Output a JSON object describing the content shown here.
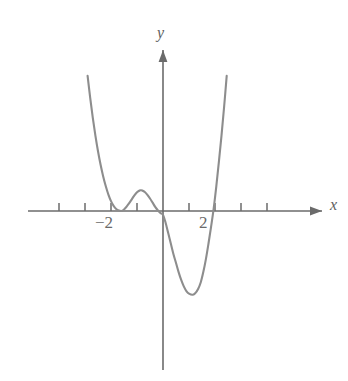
{
  "figure": {
    "background_color": "#ffffff",
    "curve_color": "#8d8d8d",
    "axis_color": "#6b6b6b",
    "text_color": "#6a6a6a"
  },
  "axes": {
    "x_label": "x",
    "y_label": "y",
    "x_axis_name": "horizontal-axis",
    "y_axis_name": "vertical-axis",
    "x_arrow": "arrow-right",
    "y_arrow": "arrow-up"
  },
  "tick_labels": {
    "negative_two": "−2",
    "positive_two": "2"
  },
  "chart_data": {
    "type": "line",
    "title": "",
    "xlabel": "x",
    "ylabel": "y",
    "grid": false,
    "legend": null,
    "xlim": [
      -4.9,
      5.4
    ],
    "ylim": [
      -6.2,
      5.2
    ],
    "x_ticks": [
      -4,
      -3,
      -2,
      -1,
      1,
      2,
      3,
      4
    ],
    "x_tick_labels_shown": [
      "-2",
      "2"
    ],
    "y_ticks": [],
    "roots": [
      -2,
      -2,
      0,
      1.95
    ],
    "features": {
      "tangent_double_root_at": -2,
      "crosses_at_origin": 0,
      "crosses_at": 1.95,
      "local_maximum": {
        "x": -0.85,
        "y": 0.8
      },
      "local_minimum": {
        "x": 1.15,
        "y": -3.2
      },
      "end_behavior": "rises on both ends (even degree, positive leading coefficient)",
      "degree": 4
    },
    "series": [
      {
        "name": "quartic-curve",
        "points": [
          [
            -2.9,
            5.2
          ],
          [
            -2.8,
            4.35
          ],
          [
            -2.7,
            3.58
          ],
          [
            -2.6,
            2.9
          ],
          [
            -2.5,
            2.3
          ],
          [
            -2.4,
            1.78
          ],
          [
            -2.3,
            1.33
          ],
          [
            -2.2,
            0.95
          ],
          [
            -2.1,
            0.63
          ],
          [
            -2.0,
            0.38
          ],
          [
            -1.9,
            0.2
          ],
          [
            -1.8,
            0.08
          ],
          [
            -1.7,
            0.02
          ],
          [
            -1.6,
            0.0
          ],
          [
            -1.5,
            0.06
          ],
          [
            -1.4,
            0.17
          ],
          [
            -1.3,
            0.3
          ],
          [
            -1.2,
            0.45
          ],
          [
            -1.1,
            0.6
          ],
          [
            -1.0,
            0.72
          ],
          [
            -0.9,
            0.79
          ],
          [
            -0.85,
            0.8
          ],
          [
            -0.8,
            0.79
          ],
          [
            -0.7,
            0.73
          ],
          [
            -0.6,
            0.62
          ],
          [
            -0.5,
            0.48
          ],
          [
            -0.4,
            0.32
          ],
          [
            -0.3,
            0.16
          ],
          [
            -0.2,
            0.03
          ],
          [
            -0.1,
            -0.08
          ],
          [
            0.0,
            -0.15
          ],
          [
            0.1,
            -0.45
          ],
          [
            0.2,
            -0.85
          ],
          [
            0.3,
            -1.25
          ],
          [
            0.4,
            -1.65
          ],
          [
            0.5,
            -2.0
          ],
          [
            0.6,
            -2.35
          ],
          [
            0.7,
            -2.65
          ],
          [
            0.8,
            -2.9
          ],
          [
            0.9,
            -3.08
          ],
          [
            1.0,
            -3.18
          ],
          [
            1.15,
            -3.22
          ],
          [
            1.25,
            -3.15
          ],
          [
            1.35,
            -3.0
          ],
          [
            1.45,
            -2.75
          ],
          [
            1.55,
            -2.35
          ],
          [
            1.65,
            -1.85
          ],
          [
            1.75,
            -1.25
          ],
          [
            1.85,
            -0.6
          ],
          [
            1.95,
            0.1
          ],
          [
            2.05,
            0.95
          ],
          [
            2.15,
            1.9
          ],
          [
            2.25,
            2.9
          ],
          [
            2.35,
            4.0
          ],
          [
            2.45,
            5.2
          ]
        ]
      }
    ]
  }
}
